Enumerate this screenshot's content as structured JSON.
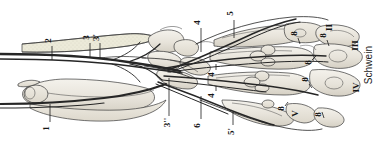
{
  "figure": {
    "species_label": "Schwein",
    "orientation": "rotated-90",
    "background_color": "#ffffff",
    "ink_color": "#1d1d1d",
    "bone_fill_color": "#e9e6de",
    "shade_color": "#cfcabd"
  },
  "digit_labels": [
    {
      "id": "digit-II",
      "text": "II",
      "x": 330,
      "y": 27
    },
    {
      "id": "digit-III",
      "text": "III",
      "x": 355,
      "y": 46
    },
    {
      "id": "digit-IV",
      "text": "IV",
      "x": 355,
      "y": 88
    },
    {
      "id": "digit-V",
      "text": "V",
      "x": 296,
      "y": 113
    }
  ],
  "numeric_labels": [
    {
      "id": "label-1",
      "text": "1",
      "x": 48,
      "y": 128
    },
    {
      "id": "label-2",
      "text": "2",
      "x": 50,
      "y": 40
    },
    {
      "id": "label-3",
      "text": "3",
      "x": 88,
      "y": 37
    },
    {
      "id": "label-3p",
      "text": "3'",
      "x": 98,
      "y": 37
    },
    {
      "id": "label-3pp",
      "text": "3''",
      "x": 167,
      "y": 122
    },
    {
      "id": "label-4-top",
      "text": "4",
      "x": 199,
      "y": 22
    },
    {
      "id": "label-4-mid",
      "text": "4",
      "x": 213,
      "y": 74
    },
    {
      "id": "label-4-low",
      "text": "4",
      "x": 213,
      "y": 95
    },
    {
      "id": "label-5-top",
      "text": "5",
      "x": 232,
      "y": 13
    },
    {
      "id": "label-5p",
      "text": "5'",
      "x": 232,
      "y": 131
    },
    {
      "id": "label-6",
      "text": "6",
      "x": 199,
      "y": 125
    },
    {
      "id": "label-8-a",
      "text": "8",
      "x": 296,
      "y": 33
    },
    {
      "id": "label-8-b",
      "text": "8",
      "x": 325,
      "y": 35
    },
    {
      "id": "label-8-c",
      "text": "8",
      "x": 310,
      "y": 62
    },
    {
      "id": "label-8-d",
      "text": "8",
      "x": 307,
      "y": 79
    },
    {
      "id": "label-8-e",
      "text": "8",
      "x": 283,
      "y": 108
    },
    {
      "id": "label-8-f",
      "text": "8",
      "x": 320,
      "y": 114
    }
  ]
}
